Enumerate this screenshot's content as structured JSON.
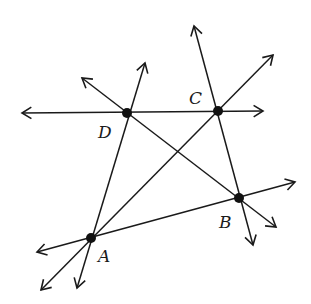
{
  "diagram": {
    "points": [
      {
        "id": "A",
        "label": "A",
        "x": 91,
        "y": 238,
        "lx": 98,
        "ly": 262
      },
      {
        "id": "B",
        "label": "B",
        "x": 239,
        "y": 198,
        "lx": 219,
        "ly": 228
      },
      {
        "id": "C",
        "label": "C",
        "x": 218,
        "y": 111,
        "lx": 189,
        "ly": 104
      },
      {
        "id": "D",
        "label": "D",
        "x": 127,
        "y": 113,
        "lx": 98,
        "ly": 138
      }
    ],
    "lines": [
      {
        "name": "line-DC",
        "x1": 22,
        "y1": 113,
        "x2": 263,
        "y2": 111
      },
      {
        "name": "line-DA",
        "x1": 145,
        "y1": 63,
        "x2": 77,
        "y2": 288
      },
      {
        "name": "line-DB",
        "x1": 82,
        "y1": 78,
        "x2": 276,
        "y2": 227
      },
      {
        "name": "line-CB",
        "x1": 194,
        "y1": 26,
        "x2": 253,
        "y2": 245
      },
      {
        "name": "line-AC",
        "x1": 273,
        "y1": 55,
        "x2": 41,
        "y2": 290
      },
      {
        "name": "line-AB",
        "x1": 295,
        "y1": 182,
        "x2": 37,
        "y2": 252
      }
    ],
    "stroke_color": "#1a1a1a"
  }
}
